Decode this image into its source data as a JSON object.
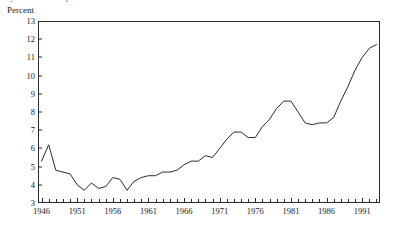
{
  "page": {
    "clipped_title": "ty and consumer prices"
  },
  "axes": {
    "y_axis_label": "Percent",
    "y_ticks": [
      3,
      4,
      5,
      6,
      7,
      8,
      9,
      10,
      11,
      12,
      13
    ],
    "x_tick_labels": [
      1946,
      1951,
      1956,
      1961,
      1966,
      1971,
      1976,
      1981,
      1986,
      1991
    ],
    "line_color": "#2b2b2b",
    "frame_color": "#2b2b2b",
    "text_color": "#1a1a1a"
  },
  "chart_data": {
    "type": "line",
    "title": "",
    "xlabel": "",
    "ylabel": "Percent",
    "xlim": [
      1945.5,
      1993.5
    ],
    "ylim": [
      3,
      13
    ],
    "grid": false,
    "legend": "none",
    "x": [
      1946,
      1947,
      1948,
      1949,
      1950,
      1951,
      1952,
      1953,
      1954,
      1955,
      1956,
      1957,
      1958,
      1959,
      1960,
      1961,
      1962,
      1963,
      1964,
      1965,
      1966,
      1967,
      1968,
      1969,
      1970,
      1971,
      1972,
      1973,
      1974,
      1975,
      1976,
      1977,
      1978,
      1979,
      1980,
      1981,
      1982,
      1983,
      1984,
      1985,
      1986,
      1987,
      1988,
      1989,
      1990,
      1991,
      1992,
      1993
    ],
    "series": [
      {
        "name": "Percent",
        "values": [
          5.3,
          6.2,
          4.8,
          4.7,
          4.6,
          4.0,
          3.7,
          4.1,
          3.8,
          3.9,
          4.4,
          4.3,
          3.7,
          4.2,
          4.4,
          4.5,
          4.5,
          4.7,
          4.7,
          4.8,
          5.1,
          5.3,
          5.3,
          5.6,
          5.5,
          6.0,
          6.5,
          6.9,
          6.9,
          6.6,
          6.6,
          7.2,
          7.6,
          8.2,
          8.6,
          8.6,
          8.0,
          7.4,
          7.3,
          7.4,
          7.4,
          7.7,
          8.6,
          9.4,
          10.3,
          11.0,
          11.5,
          11.7
        ]
      }
    ]
  }
}
